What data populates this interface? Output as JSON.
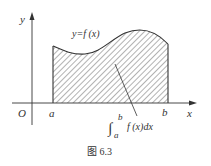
{
  "figure": {
    "caption": "图 6.3",
    "axes": {
      "x_label": "x",
      "y_label": "y",
      "origin_label": "O"
    },
    "bounds": {
      "lower": "a",
      "upper": "b"
    },
    "curve_label": "y=f (x)",
    "integral": {
      "upper_limit": "b",
      "lower_limit": "a",
      "symbol": "∫",
      "integrand": "f (x)dx"
    },
    "colors": {
      "stroke": "#333333",
      "hatch": "#555555",
      "background": "#ffffff"
    }
  }
}
